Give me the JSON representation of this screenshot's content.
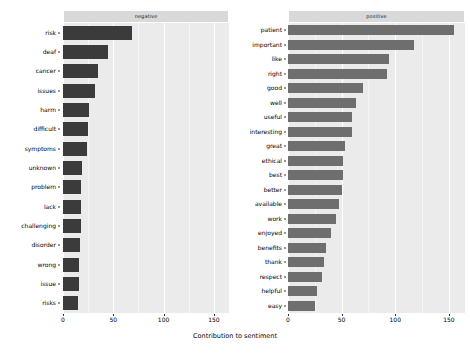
{
  "figure": {
    "xlabel": "Contribution to sentiment",
    "background": "#ffffff",
    "panel_background": "#ebebeb",
    "strip_background": "#d9d9d9"
  },
  "axis": {
    "ticks": [
      {
        "value": 0,
        "label": "0"
      },
      {
        "value": 50,
        "label": "50"
      },
      {
        "value": 100,
        "label": "100"
      },
      {
        "value": 150,
        "label": "150"
      }
    ],
    "xlim": [
      0,
      165
    ]
  },
  "chart_data": {
    "type": "bar",
    "orientation": "horizontal",
    "title": "",
    "xlabel": "Contribution to sentiment",
    "ylabel": "",
    "xlim": [
      0,
      165
    ],
    "grid": true,
    "legend": "none",
    "facets": [
      {
        "name": "negative",
        "label": "negative",
        "color": "#3b3b3b",
        "categories": [
          "risk",
          "deaf",
          "cancer",
          "issues",
          "harm",
          "difficult",
          "symptoms",
          "unknown",
          "problem",
          "lack",
          "challenging",
          "disorder",
          "wrong",
          "issue",
          "risks"
        ],
        "values": [
          69,
          45,
          35,
          32,
          26,
          25,
          24,
          19,
          18,
          18,
          18,
          17,
          16,
          16,
          15
        ]
      },
      {
        "name": "positive",
        "label": "positive",
        "color": "#6e6e6e",
        "categories": [
          "patient",
          "important",
          "like",
          "right",
          "good",
          "well",
          "useful",
          "interesting",
          "great",
          "ethical",
          "best",
          "better",
          "available",
          "work",
          "enjoyed",
          "benefits",
          "thank",
          "respect",
          "helpful",
          "easy"
        ],
        "values": [
          155,
          117,
          94,
          92,
          70,
          63,
          60,
          60,
          53,
          51,
          51,
          50,
          48,
          45,
          40,
          35,
          34,
          32,
          27,
          25
        ]
      }
    ]
  }
}
